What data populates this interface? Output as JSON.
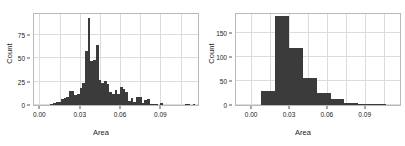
{
  "figure": {
    "panel_count": 2,
    "background": "#ffffff",
    "bar_color": "#3b3b3b",
    "frame_color": "#b9b9b9",
    "grid_color": "#dcdcdc"
  },
  "chart_data": [
    {
      "type": "bar",
      "subtype": "histogram",
      "title": "",
      "xlabel": "Area",
      "ylabel": "Count",
      "xlim": [
        -0.004,
        0.118
      ],
      "ylim": [
        0,
        97
      ],
      "xticks": [
        0.0,
        0.03,
        0.06,
        0.09
      ],
      "xticklabels": [
        "0.00",
        "0.03",
        "0.06",
        "0.09"
      ],
      "yticks": [
        0,
        25,
        50,
        75
      ],
      "yticklabels": [
        "0",
        "25",
        "50",
        "75"
      ],
      "grid": true,
      "bin_width": 0.002,
      "bin_starts": [
        0.008,
        0.01,
        0.012,
        0.014,
        0.016,
        0.018,
        0.02,
        0.022,
        0.024,
        0.026,
        0.028,
        0.03,
        0.032,
        0.034,
        0.036,
        0.038,
        0.04,
        0.042,
        0.044,
        0.046,
        0.048,
        0.05,
        0.052,
        0.054,
        0.056,
        0.058,
        0.06,
        0.062,
        0.064,
        0.066,
        0.068,
        0.07,
        0.072,
        0.074,
        0.076,
        0.078,
        0.08,
        0.082,
        0.084,
        0.086,
        0.088,
        0.09,
        0.092,
        0.094,
        0.096,
        0.098,
        0.1,
        0.102,
        0.104,
        0.106,
        0.108,
        0.11,
        0.112,
        0.114
      ],
      "values": [
        1,
        2,
        3,
        3,
        6,
        7,
        9,
        15,
        15,
        11,
        12,
        18,
        24,
        58,
        93,
        47,
        48,
        64,
        27,
        24,
        26,
        22,
        14,
        12,
        16,
        12,
        19,
        17,
        14,
        4,
        7,
        3,
        9,
        9,
        2,
        5,
        6,
        1,
        1,
        1,
        0,
        2,
        0,
        0,
        0,
        0,
        0,
        0,
        0,
        0,
        1,
        1,
        0,
        1
      ]
    },
    {
      "type": "bar",
      "subtype": "histogram",
      "title": "",
      "xlabel": "Area",
      "ylabel": "Count",
      "xlim": [
        -0.012,
        0.118
      ],
      "ylim": [
        0,
        190
      ],
      "xticks": [
        0.0,
        0.03,
        0.06,
        0.09
      ],
      "xticklabels": [
        "0.00",
        "0.03",
        "0.06",
        "0.09"
      ],
      "yticks": [
        0,
        50,
        100,
        150
      ],
      "yticklabels": [
        "0",
        "50",
        "100",
        "150"
      ],
      "grid": true,
      "bin_width": 0.011,
      "bin_starts": [
        0.008,
        0.019,
        0.03,
        0.041,
        0.052,
        0.063,
        0.074,
        0.085,
        0.096,
        0.107
      ],
      "values": [
        29,
        186,
        118,
        57,
        25,
        13,
        5,
        1,
        1,
        0
      ]
    }
  ]
}
